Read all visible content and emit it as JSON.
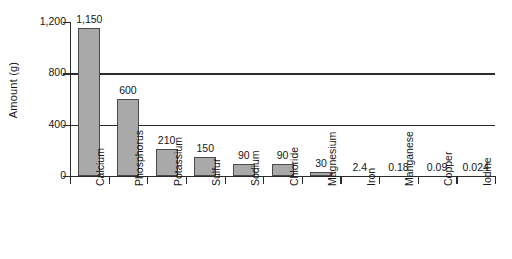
{
  "chart_data": {
    "type": "bar",
    "title": "",
    "xlabel": "",
    "ylabel": "Amount (g)",
    "ylim": [
      0,
      1200
    ],
    "yticks": [
      0,
      400,
      800,
      1200
    ],
    "ytick_labels": [
      "0",
      "400",
      "800",
      "1,200"
    ],
    "grid": "horizontal gridlines at 400 and 800, spanning full plot width",
    "legend": "none",
    "categories": [
      "Calcium",
      "Phosphorus",
      "Potassium",
      "Sulfur",
      "Sodium",
      "Chloride",
      "Magnesium",
      "Iron",
      "Manganese",
      "Copper",
      "Iodine"
    ],
    "values": [
      1150,
      600,
      210,
      150,
      90,
      90,
      30,
      2.4,
      0.18,
      0.09,
      0.024
    ],
    "value_labels": [
      "1,150",
      "600",
      "210",
      "150",
      "90",
      "90",
      "30",
      "2.4",
      "0.18",
      "0.09",
      "0.024"
    ],
    "bar_fill_color": "#a9a9a9",
    "bar_edge_color": "#4a4a4a",
    "axis_color": "#2b2b2b",
    "background_color": "#ffffff"
  }
}
